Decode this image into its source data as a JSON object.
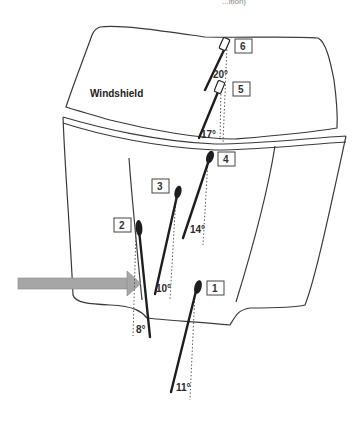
{
  "diagram": {
    "top_fragment_text": "...ition)",
    "regions": {
      "windshield_label": "Windshield",
      "hood_label": "Hood"
    },
    "impact_arrow": {
      "color": "#a6a6a6",
      "direction": "right"
    },
    "sensors": [
      {
        "id": "1",
        "label": "1",
        "angle": "11°",
        "shape": "ellipse"
      },
      {
        "id": "2",
        "label": "2",
        "angle": "8°",
        "shape": "ellipse"
      },
      {
        "id": "3",
        "label": "3",
        "angle": "10°",
        "shape": "ellipse"
      },
      {
        "id": "4",
        "label": "4",
        "angle": "14°",
        "shape": "ellipse"
      },
      {
        "id": "5",
        "label": "5",
        "angle": "17°",
        "shape": "rectangle"
      },
      {
        "id": "6",
        "label": "6",
        "angle": "20°",
        "shape": "rectangle"
      }
    ],
    "colors": {
      "outline": "#3a3a3a",
      "sensor": "#1e1e1e",
      "arrow": "#a6a6a6",
      "background": "#ffffff"
    }
  }
}
